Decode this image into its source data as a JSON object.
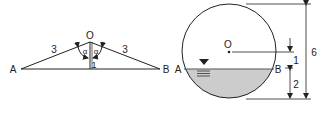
{
  "left_figure": {
    "apex_label": "O",
    "left_label": "A",
    "right_label": "B",
    "left_side_length": "3",
    "right_side_length": "3",
    "angle_left": "α",
    "angle_right": "α",
    "height": "1"
  },
  "right_figure": {
    "center_label": "O",
    "left_label": "A",
    "right_label": "B",
    "diameter_dim": "6",
    "center_to_surface_dim": "1",
    "surface_to_bottom_dim": "2",
    "fill_color": "#cccccc",
    "line_color": "#222222"
  }
}
